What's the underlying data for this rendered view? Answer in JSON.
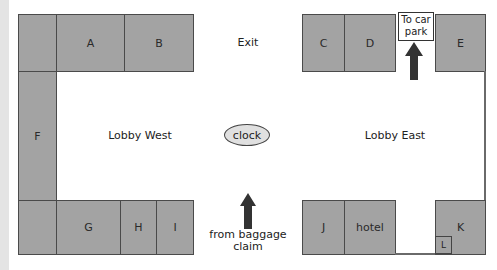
{
  "diagram": {
    "type": "floor plan",
    "areas": {
      "lobby_west": "Lobby West",
      "lobby_east": "Lobby East",
      "exit": "Exit"
    },
    "landmarks": {
      "clock": "clock",
      "car_park": "To car park",
      "car_park_line1": "To car",
      "car_park_line2": "park",
      "baggage_line1": "from baggage",
      "baggage_line2": "claim"
    },
    "units": {
      "A": "A",
      "B": "B",
      "C": "C",
      "D": "D",
      "E": "E",
      "F": "F",
      "G": "G",
      "H": "H",
      "I": "I",
      "J": "J",
      "hotel": "hotel",
      "K": "K",
      "L": "L"
    },
    "colors": {
      "unit_fill": "#a3a3a3",
      "unit_border": "#4a4a4a",
      "clock_fill": "#e0e0e0",
      "arrow": "#333333"
    }
  }
}
